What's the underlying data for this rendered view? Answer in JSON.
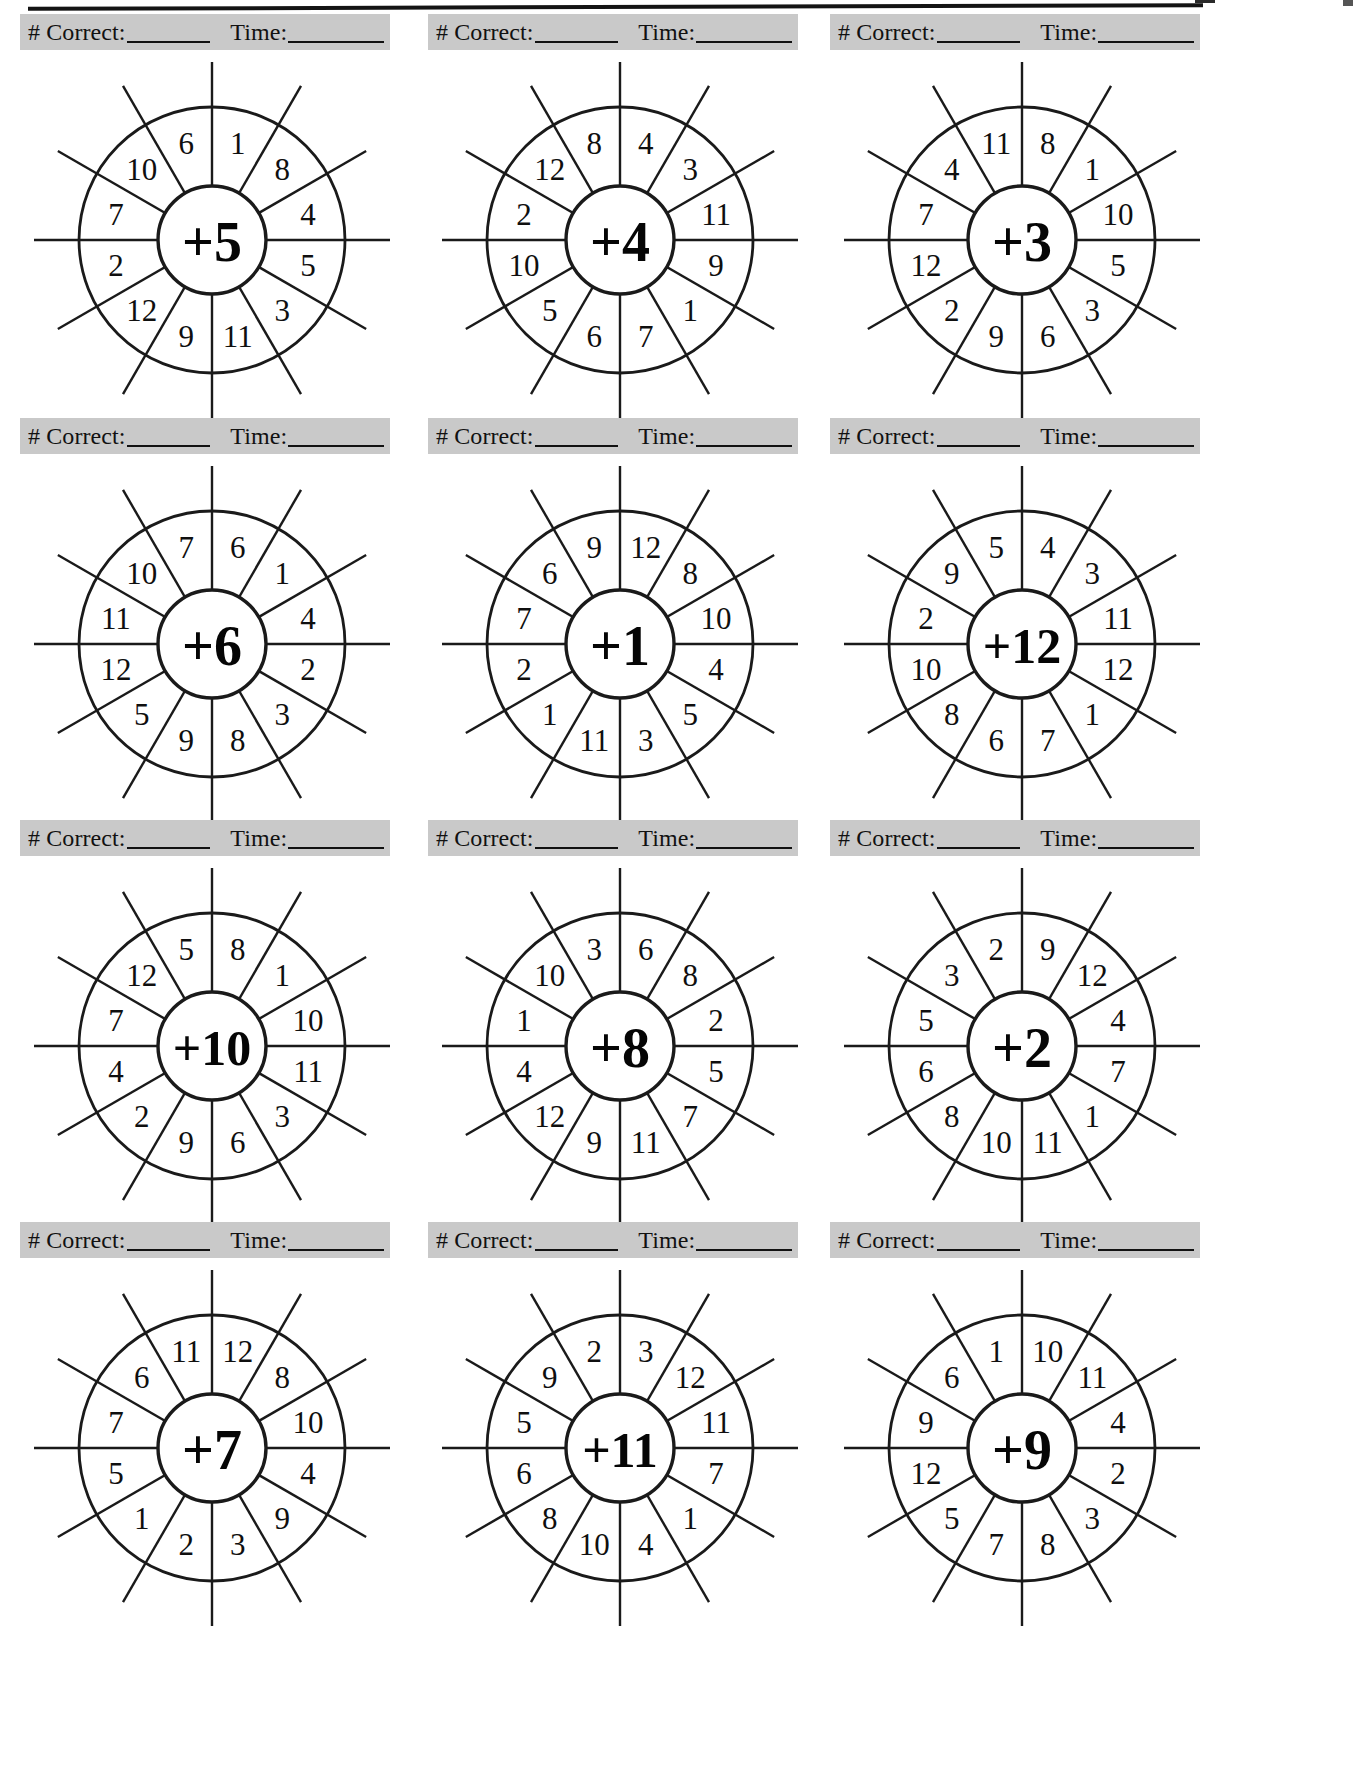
{
  "page": {
    "header_label_correct": "# Correct:",
    "header_label_time": "Time:",
    "top_rule": "horizontal-rule"
  },
  "wheels": [
    {
      "center": "+5",
      "row": 0,
      "col": 0,
      "numbers": [
        1,
        8,
        4,
        5,
        3,
        11,
        9,
        12,
        2,
        7,
        10,
        6
      ]
    },
    {
      "center": "+4",
      "row": 0,
      "col": 1,
      "numbers": [
        4,
        3,
        11,
        9,
        1,
        7,
        6,
        5,
        10,
        2,
        12,
        8
      ]
    },
    {
      "center": "+3",
      "row": 0,
      "col": 2,
      "numbers": [
        8,
        1,
        10,
        5,
        3,
        6,
        9,
        2,
        12,
        7,
        4,
        11
      ]
    },
    {
      "center": "+6",
      "row": 1,
      "col": 0,
      "numbers": [
        6,
        1,
        4,
        2,
        3,
        8,
        9,
        5,
        12,
        11,
        10,
        7
      ]
    },
    {
      "center": "+1",
      "row": 1,
      "col": 1,
      "numbers": [
        12,
        8,
        10,
        4,
        5,
        3,
        11,
        1,
        2,
        7,
        6,
        9
      ]
    },
    {
      "center": "+12",
      "row": 1,
      "col": 2,
      "numbers": [
        4,
        3,
        11,
        12,
        1,
        7,
        6,
        8,
        10,
        2,
        9,
        5
      ]
    },
    {
      "center": "+10",
      "row": 2,
      "col": 0,
      "numbers": [
        8,
        1,
        10,
        11,
        3,
        6,
        9,
        2,
        4,
        7,
        12,
        5
      ]
    },
    {
      "center": "+8",
      "row": 2,
      "col": 1,
      "numbers": [
        6,
        8,
        2,
        5,
        7,
        11,
        9,
        12,
        4,
        1,
        10,
        3
      ]
    },
    {
      "center": "+2",
      "row": 2,
      "col": 2,
      "numbers": [
        9,
        12,
        4,
        7,
        1,
        11,
        10,
        8,
        6,
        5,
        3,
        2
      ]
    },
    {
      "center": "+7",
      "row": 3,
      "col": 0,
      "numbers": [
        12,
        8,
        10,
        4,
        9,
        3,
        2,
        1,
        5,
        7,
        6,
        11
      ]
    },
    {
      "center": "+11",
      "row": 3,
      "col": 1,
      "numbers": [
        3,
        12,
        11,
        7,
        1,
        4,
        10,
        8,
        6,
        5,
        9,
        2
      ]
    },
    {
      "center": "+9",
      "row": 3,
      "col": 2,
      "numbers": [
        10,
        11,
        4,
        2,
        3,
        8,
        7,
        5,
        12,
        9,
        6,
        1
      ]
    }
  ],
  "colors": {
    "header_band": "#c9c9c9",
    "ink": "#111111",
    "paper": "#ffffff"
  }
}
